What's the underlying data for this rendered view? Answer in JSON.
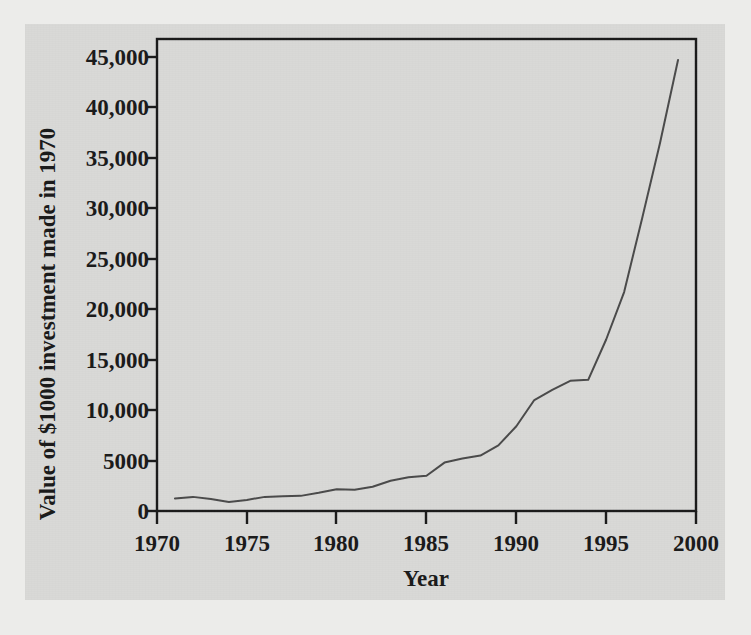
{
  "chart_data": {
    "type": "line",
    "title": "",
    "xlabel": "Year",
    "ylabel": "Value of $1000 investment made in 1970",
    "xlim": [
      1970,
      2000
    ],
    "ylim": [
      0,
      46000
    ],
    "xticks": [
      "1970",
      "1975",
      "1980",
      "1985",
      "1990",
      "1995",
      "2000"
    ],
    "xtick_values": [
      1970,
      1975,
      1980,
      1985,
      1990,
      1995,
      2000
    ],
    "yticks": [
      "0",
      "5000",
      "10,000",
      "15,000",
      "20,000",
      "25,000",
      "30,000",
      "35,000",
      "40,000",
      "45,000"
    ],
    "ytick_values": [
      0,
      5000,
      10000,
      15000,
      20000,
      25000,
      30000,
      35000,
      40000,
      45000
    ],
    "grid": false,
    "legend": false,
    "legend_position": "none",
    "line_color": "#4a4a4a",
    "series": [
      {
        "name": "Value of $1000 investment made in 1970",
        "x": [
          1971,
          1972,
          1973,
          1974,
          1975,
          1976,
          1977,
          1978,
          1979,
          1980,
          1981,
          1982,
          1983,
          1984,
          1985,
          1986,
          1987,
          1988,
          1989,
          1990,
          1991,
          1992,
          1993,
          1994,
          1995,
          1996,
          1997,
          1998,
          1999
        ],
        "values": [
          1250,
          1400,
          1200,
          900,
          1100,
          1400,
          1450,
          1500,
          1800,
          2150,
          2100,
          2400,
          3000,
          3350,
          3500,
          4800,
          5200,
          5500,
          6500,
          8400,
          11000,
          12000,
          12900,
          13000,
          17000,
          21700,
          29000,
          36500,
          44700
        ]
      }
    ]
  },
  "colors": {
    "page_background": "#ececea",
    "figure_background": "#d9d9d7",
    "axis": "#1a1a1a",
    "line": "#4a4a4a"
  }
}
